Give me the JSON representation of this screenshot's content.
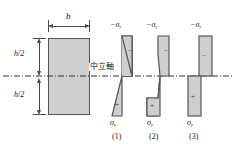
{
  "figure": {
    "kind": "engineering-cross-section-stress-diagram",
    "section": {
      "width_label": "b",
      "half_depth_label_top": "h/2",
      "half_depth_label_bottom": "h/2",
      "fill_color": "#cfcfcf",
      "edge_color": "#555555"
    },
    "neutral_axis": {
      "label": "中立軸",
      "style": "dash-dot",
      "color": "#333333"
    },
    "diagrams": [
      {
        "caption": "(1)",
        "top_label": "−σ",
        "top_sub": "y",
        "bottom_label": "σ",
        "bottom_sub": "y",
        "top_sign": "−",
        "bottom_sign": "+",
        "shape": "linear-bowtie-triangles"
      },
      {
        "caption": "(2)",
        "top_label": "−σ",
        "top_sub": "y",
        "bottom_label": "σ",
        "bottom_sub": "y",
        "top_sign": "−",
        "bottom_sign": "+",
        "shape": "elastic-plastic-trapezoids"
      },
      {
        "caption": "(3)",
        "top_label": "−σ",
        "top_sub": "y",
        "bottom_label": "σ",
        "bottom_sub": "y",
        "top_sign": "−",
        "bottom_sign": "+",
        "shape": "fully-plastic-rectangles"
      }
    ]
  }
}
